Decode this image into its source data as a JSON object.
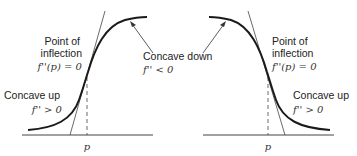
{
  "figure": {
    "left_panel": {
      "inflection_label_line1": "Point of",
      "inflection_label_line2": "inflection",
      "inflection_condition": "f''(p) = 0",
      "concave_up_label": "Concave up",
      "concave_up_condition": "f'' > 0",
      "concave_down_label": "Concave down",
      "concave_down_condition": "f'' < 0",
      "axis_point_label": "p",
      "curve_type": "increasing S-curve"
    },
    "right_panel": {
      "inflection_label_line1": "Point of",
      "inflection_label_line2": "inflection",
      "inflection_condition": "f''(p) = 0",
      "concave_up_label": "Concave up",
      "concave_up_condition": "f'' > 0",
      "axis_point_label": "p",
      "curve_type": "decreasing S-curve"
    },
    "colors": {
      "curve": "#1a1a1a",
      "lines": "#333333",
      "text": "#222222"
    }
  }
}
